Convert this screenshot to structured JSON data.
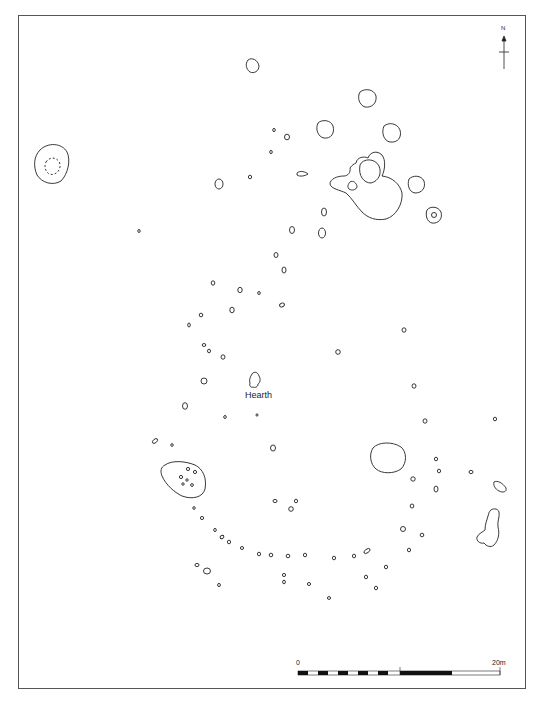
{
  "plan": {
    "labels": {
      "hearth": "Hearth",
      "north": "N"
    },
    "scale_bar": {
      "start_label": "0",
      "end_label": "20m",
      "segments": 10
    },
    "colors": {
      "line": "#222222",
      "frame": "#555555",
      "background": "#ffffff"
    }
  }
}
